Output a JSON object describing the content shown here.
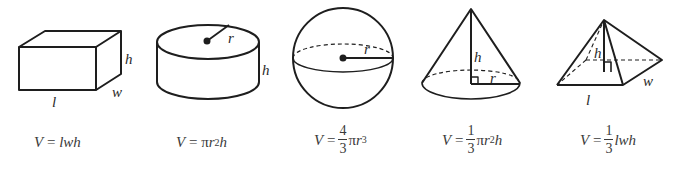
{
  "figure": {
    "type": "volume-formulas-of-solids",
    "shapes": [
      {
        "name": "rectangular-prism",
        "labels": {
          "length": "l",
          "width": "w",
          "height": "h"
        },
        "formula": {
          "lhs": "V",
          "eq": "=",
          "rhs_parts": [
            "lwh"
          ],
          "text": "V = lwh"
        }
      },
      {
        "name": "cylinder",
        "labels": {
          "radius": "r",
          "height": "h"
        },
        "formula": {
          "lhs": "V",
          "eq": "=",
          "pi": "π",
          "var": "r",
          "exp": "2",
          "tail": "h",
          "text": "V = πr²h"
        }
      },
      {
        "name": "sphere",
        "labels": {
          "radius": "r"
        },
        "formula": {
          "lhs": "V",
          "eq": "=",
          "num": "4",
          "den": "3",
          "pi": "π",
          "var": "r",
          "exp": "3",
          "text": "V = (4/3)πr³"
        }
      },
      {
        "name": "cone",
        "labels": {
          "radius": "r",
          "height": "h"
        },
        "formula": {
          "lhs": "V",
          "eq": "=",
          "num": "1",
          "den": "3",
          "pi": "π",
          "var": "r",
          "exp": "2",
          "tail": "h",
          "text": "V = (1/3)πr²h"
        }
      },
      {
        "name": "rectangular-pyramid",
        "labels": {
          "length": "l",
          "width": "w",
          "height": "h"
        },
        "formula": {
          "lhs": "V",
          "eq": "=",
          "num": "1",
          "den": "3",
          "tail": "lwh",
          "text": "V = (1/3)lwh"
        }
      }
    ],
    "colors": {
      "stroke": "#1e1e1e",
      "text": "#2a2a2a",
      "background": "#ffffff"
    }
  }
}
